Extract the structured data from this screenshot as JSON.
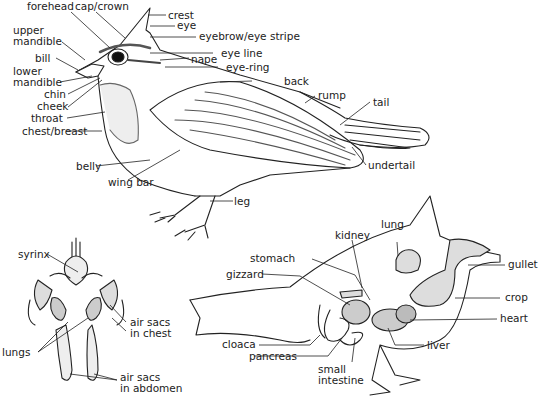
{
  "external_anatomy": {
    "labels": {
      "forehead": "forehead",
      "cap_crown": "cap/crown",
      "crest": "crest",
      "eye": "eye",
      "eyebrow": "eyebrow/eye stripe",
      "upper_mandible_1": "upper",
      "upper_mandible_2": "mandible",
      "bill": "bill",
      "lower_mandible_1": "lower",
      "lower_mandible_2": "mandible",
      "eye_line": "eye line",
      "nape": "nape",
      "eye_ring": "eye-ring",
      "chin": "chin",
      "cheek": "cheek",
      "throat": "throat",
      "back": "back",
      "chest_breast": "chest/breast",
      "rump": "rump",
      "tail": "tail",
      "undertail": "undertail",
      "belly": "belly",
      "wing_bar": "wing bar",
      "leg": "leg"
    }
  },
  "respiratory": {
    "labels": {
      "syrinx": "syrinx",
      "air_sacs_chest_1": "air sacs",
      "air_sacs_chest_2": "in chest",
      "lungs": "lungs",
      "air_sacs_abdomen_1": "air sacs",
      "air_sacs_abdomen_2": "in abdomen"
    }
  },
  "internal_anatomy": {
    "labels": {
      "lung": "lung",
      "kidney": "kidney",
      "stomach": "stomach",
      "gizzard": "gizzard",
      "gullet": "gullet",
      "crop": "crop",
      "heart": "heart",
      "cloaca": "cloaca",
      "pancreas": "pancreas",
      "liver": "liver",
      "small_intestine_1": "small",
      "small_intestine_2": "intestine"
    }
  }
}
